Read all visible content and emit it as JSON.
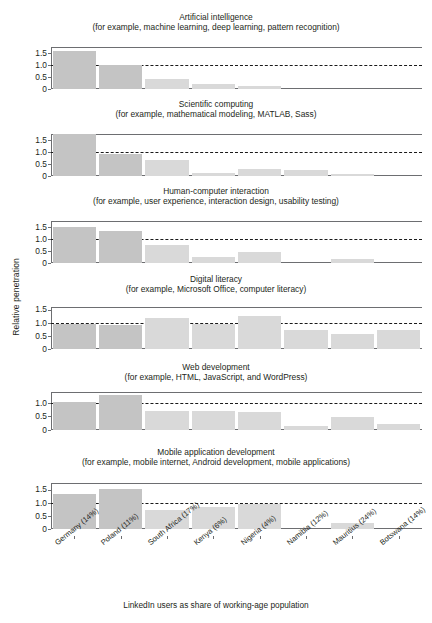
{
  "figure": {
    "ylabel": "Relative penetration",
    "caption": "LinkedIn users as share of working-age population"
  },
  "chart_data": {
    "type": "bar",
    "xlabel": "LinkedIn users as share of working-age population",
    "ylabel": "Relative penetration",
    "grid": false,
    "legend": null,
    "reference_line": 1.0,
    "categories": [
      "Germany (14%)",
      "Poland (11%)",
      "South Africa (17%)",
      "Kenya (6%)",
      "Nigeria (4%)",
      "Namibia (12%)",
      "Mauritius (24%)",
      "Botswana (14%)"
    ],
    "panels": [
      {
        "title": "Artificial intelligence",
        "subtitle": "(for example, machine learning, deep learning, pattern recognition)",
        "ylim": [
          0,
          1.75
        ],
        "yticks": [
          "1.5",
          "1.0",
          "0.5",
          "0"
        ],
        "ytickvals": [
          1.5,
          1.0,
          0.5,
          0
        ],
        "values": [
          1.6,
          1.0,
          0.42,
          0.2,
          0.13,
          0,
          0,
          0
        ]
      },
      {
        "title": "Scientific computing",
        "subtitle": "(for example, mathematical modeling, MATLAB, Sass)",
        "ylim": [
          0,
          1.75
        ],
        "yticks": [
          "1.5",
          "1.0",
          "0.5",
          "0"
        ],
        "ytickvals": [
          1.5,
          1.0,
          0.5,
          0
        ],
        "values": [
          1.75,
          0.92,
          0.65,
          0.12,
          0.3,
          0.26,
          0.08,
          0
        ]
      },
      {
        "title": "Human-computer interaction",
        "subtitle": "(for example, user experience, interaction design, usability testing)",
        "ylim": [
          0,
          1.75
        ],
        "yticks": [
          "1.5",
          "1.0",
          "0.5",
          "0"
        ],
        "ytickvals": [
          1.5,
          1.0,
          0.5,
          0
        ],
        "values": [
          1.48,
          1.35,
          0.77,
          0.24,
          0.47,
          0,
          0.18,
          0
        ]
      },
      {
        "title": "Digital literacy",
        "subtitle": "(for example, Microsoft Office, computer literacy)",
        "ylim": [
          0,
          1.6
        ],
        "yticks": [
          "1.5",
          "1.0",
          "0.5",
          "0"
        ],
        "ytickvals": [
          1.5,
          1.0,
          0.5,
          0
        ],
        "values": [
          0.96,
          0.9,
          1.2,
          0.95,
          1.24,
          0.73,
          0.58,
          0.73
        ]
      },
      {
        "title": "Web development",
        "subtitle": "(for example, HTML, JavaScript, and WordPress)",
        "ylim": [
          0,
          1.4
        ],
        "yticks": [
          "1.0",
          "0.5",
          "0"
        ],
        "ytickvals": [
          1.0,
          0.5,
          0
        ],
        "values": [
          1.05,
          1.28,
          0.7,
          0.69,
          0.68,
          0.16,
          0.48,
          0.23
        ]
      },
      {
        "title": "Mobile application development",
        "subtitle": "(for example, mobile internet, Android development, mobile applications)",
        "ylim": [
          0,
          1.75
        ],
        "yticks": [
          "1.5",
          "1.0",
          "0.5",
          "0"
        ],
        "ytickvals": [
          1.5,
          1.0,
          0.5,
          0
        ],
        "values": [
          1.32,
          1.52,
          0.74,
          0.85,
          0.97,
          0,
          0.24,
          0
        ]
      }
    ],
    "colors": {
      "bar_dark": "#c4c4c4",
      "bar_light": "#d9d9d9",
      "axis": "#6d6e71",
      "text": "#231f20",
      "reference_line": "#1a1a1a"
    }
  }
}
